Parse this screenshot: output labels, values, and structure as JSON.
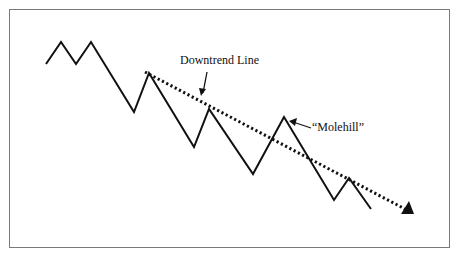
{
  "diagram": {
    "labels": {
      "downtrend": "Downtrend Line",
      "molehill": "“Molehill”"
    },
    "colors": {
      "line": "#111111",
      "frame": "#7a7a7a",
      "background": "#ffffff"
    },
    "price_path": [
      [
        46,
        64
      ],
      [
        61,
        42
      ],
      [
        76,
        64
      ],
      [
        91,
        42
      ],
      [
        134,
        112
      ],
      [
        149,
        73
      ],
      [
        194,
        147
      ],
      [
        209,
        109
      ],
      [
        253,
        174
      ],
      [
        284,
        117
      ],
      [
        334,
        200
      ],
      [
        349,
        178
      ],
      [
        371,
        209
      ]
    ],
    "trend_line": {
      "from": [
        145,
        72
      ],
      "to": [
        405,
        209
      ],
      "style": "dotted",
      "arrow_end": [
        414,
        214
      ]
    }
  }
}
